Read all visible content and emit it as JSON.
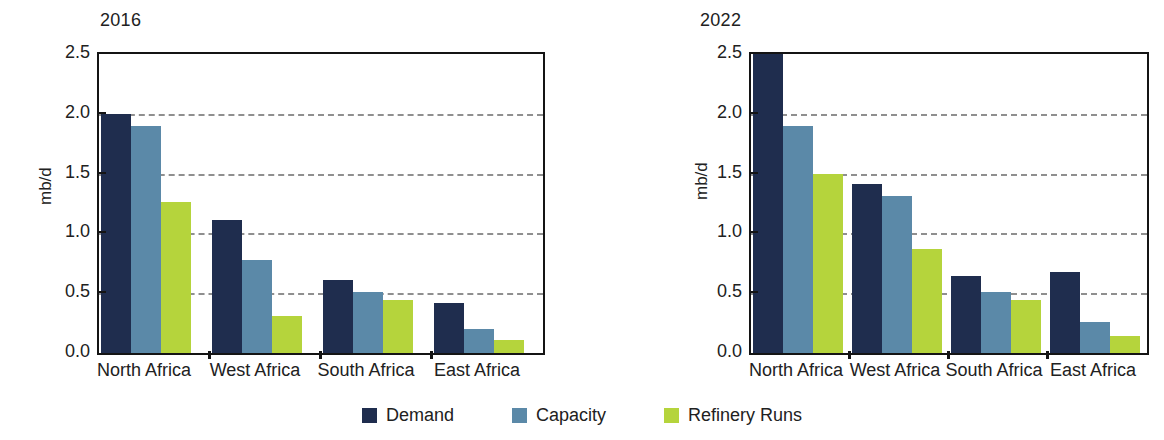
{
  "figure": {
    "ylabel": "mb/d",
    "legend": {
      "position": "bottom-center",
      "items": [
        {
          "name": "Demand",
          "color": "#1f2d4e"
        },
        {
          "name": "Capacity",
          "color": "#5b89a8"
        },
        {
          "name": "Refinery Runs",
          "color": "#b5d43c"
        }
      ]
    }
  },
  "chart_data": [
    {
      "type": "bar",
      "title": "2016",
      "xlabel": "",
      "ylabel": "mb/d",
      "ylim": [
        0,
        2.5
      ],
      "yticks": [
        "0.0",
        "0.5",
        "1.0",
        "1.5",
        "2.0",
        "2.5"
      ],
      "ytick_values": [
        0.0,
        0.5,
        1.0,
        1.5,
        2.0,
        2.5
      ],
      "grid": "horizontal-dashed",
      "categories": [
        "North Africa",
        "West Africa",
        "South Africa",
        "East Africa"
      ],
      "series": [
        {
          "name": "Demand",
          "color": "#1f2d4e",
          "values": [
            2.0,
            1.11,
            0.61,
            0.42
          ]
        },
        {
          "name": "Capacity",
          "color": "#5b89a8",
          "values": [
            1.9,
            0.78,
            0.51,
            0.2
          ]
        },
        {
          "name": "Refinery Runs",
          "color": "#b5d43c",
          "values": [
            1.26,
            0.31,
            0.44,
            0.11
          ]
        }
      ]
    },
    {
      "type": "bar",
      "title": "2022",
      "xlabel": "",
      "ylabel": "mb/d",
      "ylim": [
        0,
        2.5
      ],
      "yticks": [
        "0.0",
        "0.5",
        "1.0",
        "1.5",
        "2.0",
        "2.5"
      ],
      "ytick_values": [
        0.0,
        0.5,
        1.0,
        1.5,
        2.0,
        2.5
      ],
      "grid": "horizontal-dashed",
      "categories": [
        "North Africa",
        "West Africa",
        "South Africa",
        "East Africa"
      ],
      "series": [
        {
          "name": "Demand",
          "color": "#1f2d4e",
          "values": [
            2.65,
            1.41,
            0.64,
            0.68
          ],
          "clipped": [
            true,
            false,
            false,
            false
          ]
        },
        {
          "name": "Capacity",
          "color": "#5b89a8",
          "values": [
            1.9,
            1.31,
            0.51,
            0.26
          ]
        },
        {
          "name": "Refinery Runs",
          "color": "#b5d43c",
          "values": [
            1.5,
            0.87,
            0.44,
            0.14
          ]
        }
      ]
    }
  ]
}
